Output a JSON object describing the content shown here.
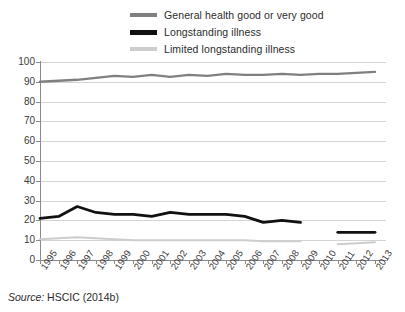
{
  "source_note": {
    "prefix": "Source:",
    "text": " HSCIC (2014b)"
  },
  "legend": {
    "position": "top-center",
    "items": [
      {
        "label": "General health good or very good",
        "color": "#808080",
        "swatch": "line-swatch-grey"
      },
      {
        "label": "Longstanding illness",
        "color": "#111111",
        "swatch": "line-swatch-black"
      },
      {
        "label": "Limited longstanding illness",
        "color": "#cdcdcd",
        "swatch": "line-swatch-lightgrey"
      }
    ]
  },
  "axis": {
    "y_ticks": [
      "100",
      "90",
      "80",
      "70",
      "60",
      "50",
      "40",
      "30",
      "20",
      "10",
      "0"
    ],
    "x_ticks": [
      "1995",
      "1996",
      "1997",
      "1998",
      "1999",
      "2000",
      "2001",
      "2002",
      "2003",
      "2004",
      "2005",
      "2006",
      "2007",
      "2008",
      "2009",
      "2010",
      "2011",
      "2012",
      "2013"
    ]
  },
  "chart_data": {
    "type": "line",
    "title": "",
    "subtitle": "",
    "xlabel": "",
    "ylabel": "",
    "xlim": [
      1995,
      2013
    ],
    "ylim": [
      0,
      100
    ],
    "ytick_step": 10,
    "grid": true,
    "legend_position": "top-center",
    "categories": [
      "1995",
      "1996",
      "1997",
      "1998",
      "1999",
      "2000",
      "2001",
      "2002",
      "2003",
      "2004",
      "2005",
      "2006",
      "2007",
      "2008",
      "2009",
      "2010",
      "2011",
      "2012",
      "2013"
    ],
    "series": [
      {
        "name": "General health good or very good",
        "color": "#808080",
        "values": [
          90,
          90.5,
          91,
          92,
          93,
          92.5,
          93.5,
          92.5,
          93.5,
          93,
          94,
          93.5,
          93.5,
          94,
          93.5,
          94,
          94,
          94.5,
          95
        ]
      },
      {
        "name": "Longstanding illness",
        "color": "#111111",
        "values": [
          21,
          22,
          27,
          24,
          23,
          23,
          22,
          24,
          23,
          23,
          23,
          22,
          19,
          20,
          19,
          null,
          14,
          14,
          14
        ]
      },
      {
        "name": "Limited longstanding illness",
        "color": "#cdcdcd",
        "values": [
          10.5,
          11,
          11.5,
          11,
          10.5,
          10,
          10,
          10,
          10,
          10,
          10,
          10,
          9.5,
          9.5,
          9.5,
          null,
          8,
          8.5,
          9
        ]
      }
    ]
  }
}
